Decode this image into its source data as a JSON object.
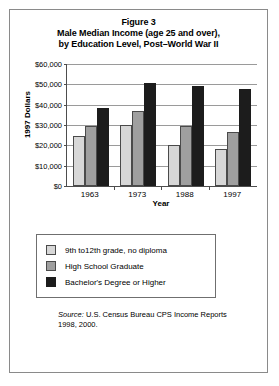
{
  "figure": {
    "title_lines": [
      "Figure 3",
      "Male Median Income (age 25 and over),",
      "by Education Level, Post–World War II"
    ],
    "source_label": "Source:",
    "source_text": " U.S. Census Bureau CPS Income Reports",
    "source_line2": "1998, 2000."
  },
  "legend": {
    "items": [
      {
        "label": "9th to12th grade, no diploma",
        "color": "#d7d7d7"
      },
      {
        "label": "High School Graduate",
        "color": "#9f9f9f"
      },
      {
        "label": "Bachelor's Degree or Higher",
        "color": "#1c1c1c"
      }
    ]
  },
  "axis": {
    "y_ticks": [
      "$60,000",
      "$50,000",
      "$40,000",
      "$30,000",
      "$20,000",
      "$10,000",
      "$0"
    ],
    "x_ticks": [
      "1963",
      "1973",
      "1988",
      "1997"
    ]
  },
  "chart_data": {
    "type": "bar",
    "xlabel": "Year",
    "ylabel": "1997 Dollars",
    "categories": [
      "1963",
      "1973",
      "1988",
      "1997"
    ],
    "series": [
      {
        "name": "9th to12th grade, no diploma",
        "color": "#d7d7d7",
        "values": [
          24500,
          30000,
          20000,
          18000
        ]
      },
      {
        "name": "High School Graduate",
        "color": "#9f9f9f",
        "values": [
          29500,
          37000,
          29500,
          26500
        ]
      },
      {
        "name": "Bachelor's Degree or Higher",
        "color": "#1c1c1c",
        "values": [
          38500,
          50500,
          49000,
          47500
        ]
      }
    ],
    "ylim": [
      0,
      60000
    ],
    "ytick_values": [
      0,
      10000,
      20000,
      30000,
      40000,
      50000,
      60000
    ],
    "ytick_labels": [
      "$0",
      "$10,000",
      "$20,000",
      "$30,000",
      "$40,000",
      "$50,000",
      "$60,000"
    ],
    "grid": true,
    "legend_position": "below-plot",
    "source": "Source: U.S. Census Bureau CPS Income Reports 1998, 2000."
  }
}
